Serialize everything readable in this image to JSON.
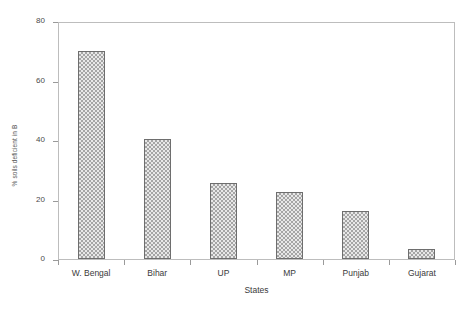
{
  "chart_data": {
    "type": "bar",
    "title": "",
    "subtitle": "",
    "xlabel": "States",
    "ylabel": "% soils deficient in B",
    "categories": [
      "W. Bengal",
      "Bihar",
      "UP",
      "MP",
      "Punjab",
      "Gujarat"
    ],
    "values": [
      70,
      40.5,
      25.5,
      22.5,
      16,
      3.5
    ],
    "ylim": [
      0,
      80
    ],
    "yticks": [
      0,
      20,
      40,
      60,
      80
    ],
    "ytick_labels": [
      "0",
      "20",
      "40",
      "60",
      "80"
    ],
    "grid": false,
    "legend": false,
    "legend_position": "none",
    "annotations": [],
    "colors": {
      "bar_fill": "#a5a5a5",
      "bar_pattern": "#e8e8e8",
      "bar_edge": "#6e6e6e",
      "axis": "#9a9a9a",
      "frame": "#bdbdbd",
      "text": "#3a3a3a",
      "background": "#ffffff"
    }
  }
}
